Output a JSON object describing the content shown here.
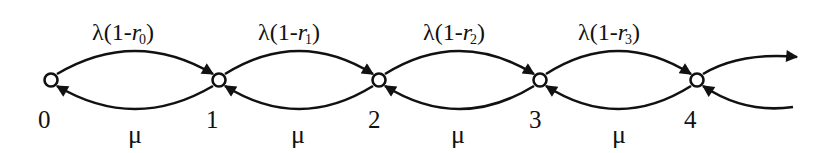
{
  "diagram": {
    "type": "birth-death-markov-chain",
    "stroke_color": "#111111",
    "background": "#ffffff",
    "states": [
      {
        "id": "0",
        "label": "0",
        "x": 51,
        "y": 80
      },
      {
        "id": "1",
        "label": "1",
        "x": 219,
        "y": 80
      },
      {
        "id": "2",
        "label": "2",
        "x": 379,
        "y": 80
      },
      {
        "id": "3",
        "label": "3",
        "x": 540,
        "y": 80
      },
      {
        "id": "4",
        "label": "4",
        "x": 697,
        "y": 80
      }
    ],
    "forward_transitions": [
      {
        "from": "0",
        "to": "1",
        "prefix": "λ(1-",
        "var": "r",
        "sub": "0",
        "suffix": ")"
      },
      {
        "from": "1",
        "to": "2",
        "prefix": "λ(1-",
        "var": "r",
        "sub": "1",
        "suffix": ")"
      },
      {
        "from": "2",
        "to": "3",
        "prefix": "λ(1-",
        "var": "r",
        "sub": "2",
        "suffix": ")"
      },
      {
        "from": "3",
        "to": "4",
        "prefix": "λ(1-",
        "var": "r",
        "sub": "3",
        "suffix": ")"
      }
    ],
    "backward_transitions": [
      {
        "from": "1",
        "to": "0",
        "label": "μ"
      },
      {
        "from": "2",
        "to": "1",
        "label": "μ"
      },
      {
        "from": "3",
        "to": "2",
        "label": "μ"
      },
      {
        "from": "4",
        "to": "3",
        "label": "μ"
      }
    ],
    "continuation": {
      "outgoing_from": "4",
      "incoming_to": "4"
    }
  }
}
